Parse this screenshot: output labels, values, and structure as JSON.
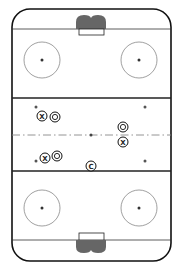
{
  "diagram": {
    "type": "hockey-rink",
    "colors": {
      "background": "#ffffff",
      "board": "#111111",
      "lines": "#222222",
      "circle": "#777777",
      "centerline": "#888888",
      "net": "#666666"
    },
    "players": [
      {
        "id": "p1",
        "label": "X",
        "team": "x"
      },
      {
        "id": "p2",
        "label": "O",
        "team": "o"
      },
      {
        "id": "p3",
        "label": "O",
        "team": "o"
      },
      {
        "id": "p4",
        "label": "X",
        "team": "x"
      },
      {
        "id": "p5",
        "label": "X",
        "team": "x"
      },
      {
        "id": "p6",
        "label": "O",
        "team": "o"
      },
      {
        "id": "p7",
        "label": "C",
        "team": "coach"
      }
    ]
  }
}
